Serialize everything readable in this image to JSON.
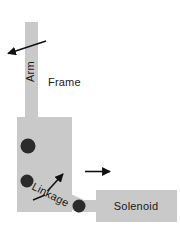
{
  "diagram": {
    "background_color": "#ffffff",
    "part_fill_color": "#c9c9c9",
    "pivot_color": "#2b2b2b",
    "arrow_color": "#111111",
    "label_color": "#1a1a1a",
    "labels": {
      "arm": "Arm",
      "frame": "Frame",
      "linkage": "Linkage",
      "solenoid": "Solenoid"
    },
    "parts": [
      {
        "name": "arm-bar",
        "label": "Arm",
        "shape": "vertical-bar"
      },
      {
        "name": "frame-body",
        "label": "Frame",
        "shape": "rectangle"
      },
      {
        "name": "linkage-bar",
        "label": "Linkage",
        "shape": "diagonal-bar"
      },
      {
        "name": "solenoid-body",
        "label": "Solenoid",
        "shape": "rectangle"
      }
    ],
    "pivots": [
      {
        "name": "arm-pivot-upper",
        "cx": 28,
        "cy": 146,
        "r": 7
      },
      {
        "name": "arm-pivot-lower",
        "cx": 27,
        "cy": 181,
        "r": 6
      },
      {
        "name": "linkage-pivot",
        "cx": 79,
        "cy": 206,
        "r": 6
      }
    ],
    "arrows": [
      {
        "name": "arm-motion-arrow",
        "direction": "left-up",
        "x1": 46,
        "y1": 41,
        "x2": 5,
        "y2": 54
      },
      {
        "name": "linkage-motion-arrow",
        "direction": "up-right",
        "x1": 47,
        "y1": 192,
        "x2": 65,
        "y2": 172
      },
      {
        "name": "solenoid-motion-arrow",
        "direction": "right",
        "x1": 85,
        "y1": 172,
        "x2": 113,
        "y2": 172
      }
    ]
  }
}
